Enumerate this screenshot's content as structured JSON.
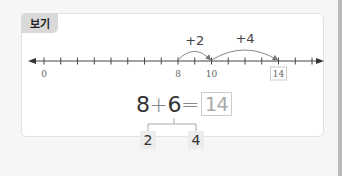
{
  "example": {
    "tag_label": "보기",
    "number_line": {
      "start": 0,
      "end": 16,
      "labels": [
        {
          "value": 0,
          "text": "0",
          "boxed": false
        },
        {
          "value": 8,
          "text": "8",
          "boxed": false
        },
        {
          "value": 10,
          "text": "10",
          "boxed": false
        },
        {
          "value": 14,
          "text": "14",
          "boxed": true
        }
      ],
      "jumps": [
        {
          "from": 8,
          "to": 10,
          "label": "+2"
        },
        {
          "from": 10,
          "to": 14,
          "label": "+4"
        }
      ]
    },
    "equation": {
      "left": "8",
      "plus": "+",
      "right": "6",
      "equals": "=",
      "answer": "14"
    },
    "decomposition": {
      "part1": "2",
      "part2": "4"
    }
  }
}
